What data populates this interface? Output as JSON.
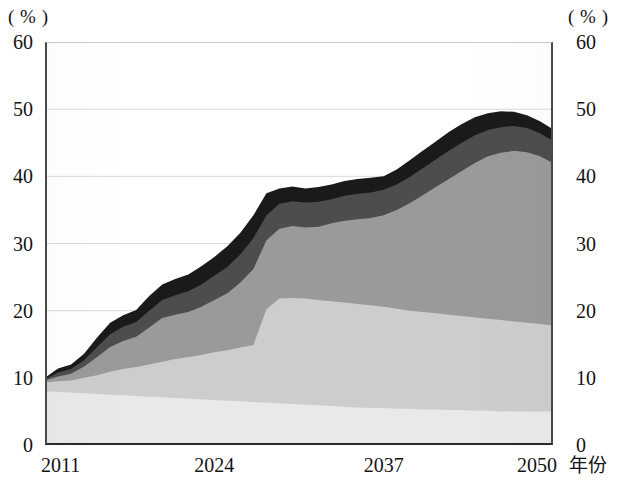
{
  "axes": {
    "left_unit_label": "( % )",
    "right_unit_label": "( % )",
    "x_axis_title": "年份",
    "y_ticks": [
      "60",
      "50",
      "40",
      "30",
      "20",
      "10",
      "0"
    ],
    "y_ticks_right": [
      "60",
      "50",
      "40",
      "30",
      "20",
      "10",
      "0"
    ],
    "x_ticks": [
      "2011",
      "2024",
      "2037",
      "2050"
    ]
  },
  "colors": {
    "layer1": "#e9e9e9",
    "layer2": "#cdcdcd",
    "layer3": "#9a9a9a",
    "layer4": "#4d4d4d",
    "layer5": "#1a1a1a",
    "axis": "#2b2b2b",
    "grid": "#d6d6d6"
  },
  "chart_data": {
    "type": "area",
    "title": "",
    "subtitle": "",
    "xlabel": "年份",
    "ylabel": "( % )",
    "xlim": [
      2011,
      2050
    ],
    "ylim": [
      0,
      60
    ],
    "ytick_values": [
      0,
      10,
      20,
      30,
      40,
      50,
      60
    ],
    "xtick_values": [
      2011,
      2024,
      2037,
      2050
    ],
    "grid": true,
    "legend": "none",
    "stacked": true,
    "note": "Stacked area chart, four shaded bands; values are cumulative tops read off the axis.",
    "x": [
      2011,
      2012,
      2013,
      2014,
      2015,
      2016,
      2017,
      2018,
      2019,
      2020,
      2021,
      2022,
      2023,
      2024,
      2025,
      2026,
      2027,
      2028,
      2029,
      2030,
      2031,
      2032,
      2033,
      2034,
      2035,
      2036,
      2037,
      2038,
      2039,
      2040,
      2041,
      2042,
      2043,
      2044,
      2045,
      2046,
      2047,
      2048,
      2049,
      2050
    ],
    "series": [
      {
        "name": "band-1",
        "color": "#e9e9e9",
        "values": [
          8.0,
          7.9,
          7.8,
          7.7,
          7.6,
          7.5,
          7.4,
          7.3,
          7.2,
          7.1,
          7.0,
          6.9,
          6.8,
          6.7,
          6.6,
          6.5,
          6.4,
          6.3,
          6.2,
          6.1,
          6.0,
          5.9,
          5.8,
          5.7,
          5.6,
          5.5,
          5.5,
          5.4,
          5.4,
          5.3,
          5.3,
          5.2,
          5.2,
          5.1,
          5.1,
          5.0,
          5.0,
          5.0,
          5.0,
          5.0
        ]
      },
      {
        "name": "band-2",
        "color": "#cdcdcd",
        "cumulative": [
          9.3,
          9.5,
          9.6,
          10.0,
          10.4,
          10.9,
          11.3,
          11.6,
          12.0,
          12.4,
          12.8,
          13.1,
          13.4,
          13.8,
          14.1,
          14.5,
          14.9,
          20.2,
          21.8,
          21.9,
          21.8,
          21.6,
          21.4,
          21.2,
          21.0,
          20.8,
          20.6,
          20.3,
          20.0,
          19.8,
          19.6,
          19.4,
          19.2,
          19.0,
          18.8,
          18.6,
          18.4,
          18.2,
          18.0,
          17.8
        ]
      },
      {
        "name": "band-3",
        "color": "#9a9a9a",
        "cumulative": [
          9.6,
          10.2,
          10.6,
          11.7,
          13.1,
          14.6,
          15.5,
          16.1,
          17.5,
          18.9,
          19.4,
          19.8,
          20.6,
          21.6,
          22.6,
          24.2,
          26.2,
          30.5,
          32.2,
          32.6,
          32.4,
          32.5,
          33.0,
          33.4,
          33.6,
          33.8,
          34.2,
          35.0,
          36.0,
          37.2,
          38.4,
          39.6,
          40.8,
          42.0,
          43.0,
          43.5,
          43.8,
          43.6,
          43.0,
          42.0
        ]
      },
      {
        "name": "band-4",
        "color": "#4d4d4d",
        "cumulative": [
          9.8,
          10.8,
          11.3,
          12.6,
          14.6,
          16.5,
          17.6,
          18.3,
          20.0,
          21.6,
          22.3,
          22.9,
          23.9,
          25.2,
          26.5,
          28.4,
          30.8,
          34.2,
          35.9,
          36.3,
          36.1,
          36.2,
          36.6,
          37.1,
          37.4,
          37.6,
          38.0,
          38.8,
          39.9,
          41.2,
          42.5,
          43.8,
          45.0,
          46.1,
          46.9,
          47.3,
          47.5,
          47.2,
          46.4,
          45.3
        ]
      },
      {
        "name": "band-5",
        "color": "#1a1a1a",
        "cumulative": [
          10.0,
          11.4,
          12.0,
          13.6,
          16.0,
          18.2,
          19.3,
          20.1,
          22.2,
          23.9,
          24.7,
          25.4,
          26.6,
          28.0,
          29.6,
          31.6,
          34.2,
          37.5,
          38.2,
          38.5,
          38.2,
          38.4,
          38.8,
          39.3,
          39.6,
          39.8,
          40.0,
          41.0,
          42.4,
          43.8,
          45.2,
          46.6,
          47.8,
          48.8,
          49.4,
          49.7,
          49.6,
          49.1,
          48.2,
          47.0
        ]
      }
    ]
  }
}
